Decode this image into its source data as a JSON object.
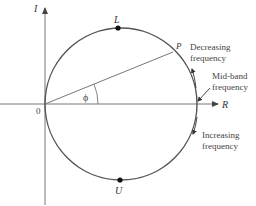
{
  "diagram": {
    "type": "circle-diagram",
    "axes": {
      "vertical_label": "I",
      "horizontal_label": "R",
      "origin_label": "0"
    },
    "points": {
      "top": "L",
      "bottom": "U",
      "phasor_tip": "P"
    },
    "angle_label": "ϕ",
    "annotations": {
      "decreasing": [
        "Decreasing",
        "frequency"
      ],
      "midband": [
        "Mid-band",
        "frequency"
      ],
      "increasing": [
        "Increasing",
        "frequency"
      ]
    },
    "colors": {
      "circle": "#555555",
      "axes": "#777777",
      "text": "#333333"
    }
  }
}
